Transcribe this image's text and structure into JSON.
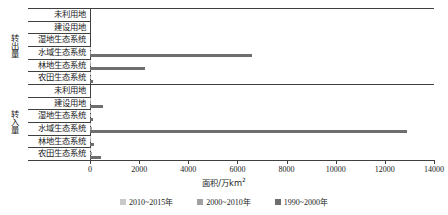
{
  "chart_data": {
    "type": "bar",
    "orientation": "horizontal",
    "title": "",
    "xlabel": "面积/万km²",
    "ylabel": "",
    "xlim": [
      0,
      14000
    ],
    "xticks": [
      0,
      2000,
      4000,
      6000,
      8000,
      10000,
      12000,
      14000
    ],
    "grid": false,
    "legend_position": "bottom",
    "legend": [
      "2010~2015年",
      "2000~2010年",
      "1990~2000年"
    ],
    "colors": {
      "2010~2015年": "#c9c9c9",
      "2000~2010年": "#a0a0a0",
      "1990~2000年": "#6e6e6e",
      "axis": "#3f3f3f"
    },
    "groups": [
      {
        "name": "转出量",
        "categories": [
          "未利用地",
          "建设用地",
          "湿地生态系统",
          "水域生态系统",
          "林地生态系统",
          "农田生态系统"
        ],
        "series": [
          {
            "name": "2010~2015年",
            "values": [
              0,
              0,
              0,
              40,
              35,
              30
            ]
          },
          {
            "name": "2000~2010年",
            "values": [
              0,
              0,
              0,
              60,
              50,
              45
            ]
          },
          {
            "name": "1990~2000年",
            "values": [
              0,
              0,
              0,
              6600,
              2240,
              110
            ]
          }
        ]
      },
      {
        "name": "转入量",
        "categories": [
          "未利用地",
          "建设用地",
          "湿地生态系统",
          "水域生态系统",
          "林地生态系统",
          "农田生态系统"
        ],
        "series": [
          {
            "name": "2010~2015年",
            "values": [
              0,
              30,
              20,
              60,
              30,
              40
            ]
          },
          {
            "name": "2000~2010年",
            "values": [
              0,
              60,
              30,
              80,
              40,
              70
            ]
          },
          {
            "name": "1990~2000年",
            "values": [
              0,
              530,
              120,
              12900,
              150,
              460
            ]
          }
        ]
      }
    ]
  }
}
